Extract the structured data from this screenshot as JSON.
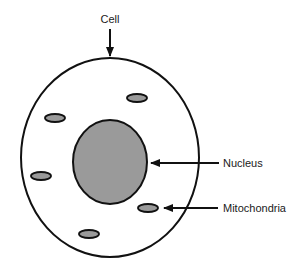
{
  "diagram": {
    "title": "Cell",
    "colors": {
      "background": "#ffffff",
      "stroke": "#111111",
      "nucleus_fill": "#9a9a9a",
      "mitochondria_fill": "#9a9a9a",
      "cell_fill": "#ffffff"
    },
    "labels": {
      "cell": "Cell",
      "nucleus": "Nucleus",
      "mitochondria": "Mitochondria"
    },
    "cell": {
      "cx": 110,
      "cy": 157.5,
      "rx": 89,
      "ry": 99.5
    },
    "nucleus": {
      "cx": 110,
      "cy": 162,
      "rx": 37,
      "ry": 42
    },
    "mitochondria": [
      {
        "cx": 55,
        "cy": 118,
        "rx": 10,
        "ry": 4
      },
      {
        "cx": 137,
        "cy": 98,
        "rx": 10,
        "ry": 4
      },
      {
        "cx": 41,
        "cy": 176,
        "rx": 10,
        "ry": 4
      },
      {
        "cx": 148,
        "cy": 208,
        "rx": 10,
        "ry": 4
      },
      {
        "cx": 89,
        "cy": 234,
        "rx": 10,
        "ry": 4
      }
    ],
    "arrows": [
      {
        "name": "cell-arrow",
        "x1": 110,
        "y1": 29,
        "x2": 110,
        "y2": 56
      },
      {
        "name": "nucleus-arrow",
        "x1": 219,
        "y1": 163,
        "x2": 151,
        "y2": 163
      },
      {
        "name": "mitochondria-arrow",
        "x1": 218,
        "y1": 208,
        "x2": 164,
        "y2": 208
      }
    ]
  }
}
